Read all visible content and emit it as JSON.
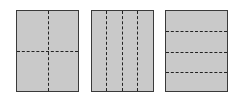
{
  "diagram": {
    "colors": {
      "fill": "#c9c9c9",
      "border": "#3a3a3a",
      "fold_line": "#222222"
    },
    "panels": [
      {
        "id": "panel-1",
        "layout": "quarters",
        "vertical_folds": 1,
        "horizontal_folds": 1
      },
      {
        "id": "panel-2",
        "layout": "vertical-strips",
        "vertical_folds": 3,
        "horizontal_folds": 0
      },
      {
        "id": "panel-3",
        "layout": "horizontal-strips",
        "vertical_folds": 0,
        "horizontal_folds": 3
      }
    ]
  }
}
